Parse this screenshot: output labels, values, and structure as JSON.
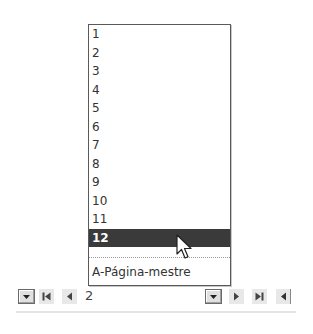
{
  "page_list": {
    "items": [
      {
        "label": "1"
      },
      {
        "label": "2"
      },
      {
        "label": "3"
      },
      {
        "label": "4"
      },
      {
        "label": "5"
      },
      {
        "label": "6"
      },
      {
        "label": "7"
      },
      {
        "label": "8"
      },
      {
        "label": "9"
      },
      {
        "label": "10"
      },
      {
        "label": "11"
      },
      {
        "label": "12"
      }
    ],
    "selected_index": 11,
    "master_page_label": "A-Página-mestre"
  },
  "nav_bar": {
    "current_page": "2",
    "buttons": {
      "left_dropdown": "chevron-down-icon",
      "first_page": "first-page-icon",
      "previous_page": "previous-page-icon",
      "page_dropdown": "chevron-down-icon",
      "next_page": "next-page-icon",
      "last_page": "last-page-icon",
      "scroll_left": "scroll-left-icon"
    }
  },
  "colors": {
    "selection_bg": "#3a3a3a",
    "selection_text": "#ffffff",
    "list_border": "#5a5a5a",
    "text": "#333333"
  }
}
